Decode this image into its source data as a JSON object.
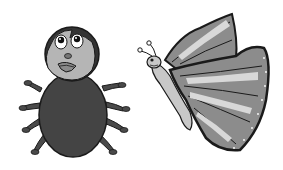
{
  "scene": {
    "description": "Grayscale clip-art of a spider-like bug and a butterfly",
    "subjects": [
      "spider",
      "butterfly"
    ]
  },
  "colors": {
    "background": "#ffffff",
    "outline": "#1a1a1a",
    "dark_body": "#444444",
    "head_face": "#b5b5b5",
    "wing_mid": "#8c8c8c",
    "wing_light": "#d8d8d8",
    "butterfly_body": "#c8c8c8"
  }
}
